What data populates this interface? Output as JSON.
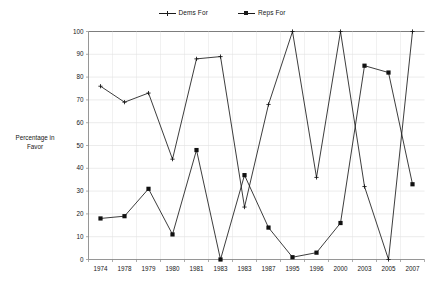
{
  "chart_data": {
    "type": "line",
    "title": "",
    "xlabel": "",
    "ylabel": "Percentage in Favor",
    "ylim": [
      0,
      100
    ],
    "ytick_step": 10,
    "yticks": [
      0,
      10,
      20,
      30,
      40,
      50,
      60,
      70,
      80,
      90,
      100
    ],
    "grid": true,
    "legend_position": "top-center",
    "categories": [
      "1974",
      "1978",
      "1979",
      "1980",
      "1981",
      "1983",
      "1983",
      "1987",
      "1995",
      "1996",
      "2000",
      "2003",
      "2005",
      "2007"
    ],
    "series": [
      {
        "name": "Dems For",
        "marker": "cross",
        "color": "#111111",
        "values": [
          76,
          69,
          73,
          44,
          88,
          89,
          23,
          68,
          100,
          36,
          100,
          32,
          0,
          100
        ]
      },
      {
        "name": "Reps For",
        "marker": "square",
        "color": "#111111",
        "values": [
          18,
          19,
          31,
          11,
          48,
          0,
          37,
          14,
          1,
          3,
          16,
          85,
          82,
          33
        ]
      }
    ]
  },
  "legend": {
    "items": [
      {
        "label": "Dems For",
        "marker_icon": "cross-marker-icon"
      },
      {
        "label": "Reps For",
        "marker_icon": "square-marker-icon"
      }
    ]
  },
  "axes": {
    "y_title": "Percentage in Favor",
    "y_title_line1": "Percentage in",
    "y_title_line2": "Favor"
  }
}
